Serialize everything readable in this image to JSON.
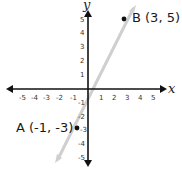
{
  "diagram": {
    "type": "coordinate-plane",
    "axes": {
      "x_label": "x",
      "y_label": "y",
      "x_ticks": [
        "-5",
        "-4",
        "-3",
        "-2",
        "-1",
        "1",
        "2",
        "3",
        "4",
        "5"
      ],
      "y_ticks": [
        "5",
        "4",
        "3",
        "2",
        "1",
        "-1",
        "-2",
        "-3",
        "-4",
        "-5"
      ],
      "range": [
        -5,
        5
      ]
    },
    "points": [
      {
        "name": "A",
        "label": "A (-1, -3)",
        "x": -1,
        "y": -3
      },
      {
        "name": "B",
        "label": "B (3, 5)",
        "x": 3,
        "y": 5
      }
    ],
    "line": {
      "through": [
        "A",
        "B"
      ],
      "color": "#c8c8c8"
    },
    "colors": {
      "axis": "#111111",
      "point": "#111111",
      "line": "#cccccc"
    }
  }
}
